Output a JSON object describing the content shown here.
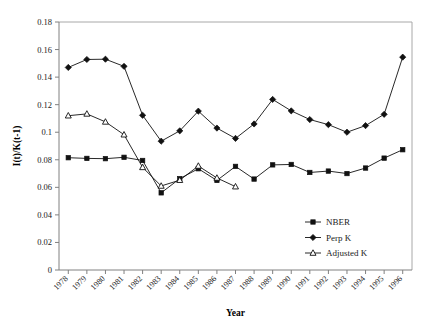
{
  "chart_data": {
    "type": "line",
    "title": "",
    "xlabel": "Year",
    "ylabel": "I(t)/K(t-1)",
    "ylim": [
      0,
      0.18
    ],
    "ytick_values": [
      0,
      0.02,
      0.04,
      0.06,
      0.08,
      0.1,
      0.12,
      0.14,
      0.16,
      0.18
    ],
    "ytick_labels": [
      "0",
      "0.02",
      "0.04",
      "0.06",
      "0.08",
      "0.1",
      "0.12",
      "0.14",
      "0.16",
      "0.18"
    ],
    "grid": false,
    "legend_position": "bottom-right",
    "categories": [
      "1978",
      "1979",
      "1980",
      "1981",
      "1982",
      "1983",
      "1984",
      "1985",
      "1986",
      "1987",
      "1988",
      "1989",
      "1990",
      "1991",
      "1992",
      "1993",
      "1994",
      "1995",
      "1996"
    ],
    "series": [
      {
        "name": "NBER",
        "marker": "filled-square",
        "values": [
          0.0815,
          0.081,
          0.0808,
          0.0818,
          0.0795,
          0.056,
          0.0663,
          0.0735,
          0.065,
          0.0752,
          0.066,
          0.0763,
          0.0766,
          0.0708,
          0.0718,
          0.07,
          0.074,
          0.0812,
          0.0873
        ]
      },
      {
        "name": "Perp K",
        "marker": "filled-diamond",
        "values": [
          0.147,
          0.1528,
          0.153,
          0.1478,
          0.1123,
          0.0935,
          0.101,
          0.1153,
          0.103,
          0.0955,
          0.106,
          0.1238,
          0.1155,
          0.1092,
          0.1055,
          0.1,
          0.1048,
          0.113,
          0.1545
        ]
      },
      {
        "name": "Adjusted K",
        "marker": "open-triangle",
        "values": [
          0.112,
          0.1133,
          0.1075,
          0.0982,
          0.0745,
          0.061,
          0.0652,
          0.0755,
          0.0668,
          0.0605,
          null,
          null,
          null,
          null,
          null,
          null,
          null,
          null,
          null
        ]
      }
    ]
  },
  "legend": {
    "items": [
      {
        "label": "NBER",
        "marker": "filled-square"
      },
      {
        "label": "Perp K",
        "marker": "filled-diamond"
      },
      {
        "label": "Adjusted K",
        "marker": "open-triangle"
      }
    ]
  }
}
